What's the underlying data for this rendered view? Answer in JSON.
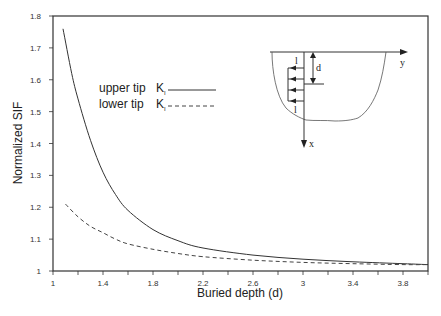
{
  "chart_data": {
    "type": "line",
    "title": "",
    "xlabel": "Buried depth  (d)",
    "ylabel": "Normalized SIF",
    "xlim": [
      1,
      4
    ],
    "ylim": [
      1,
      1.8
    ],
    "grid": false,
    "x_ticks": [
      1,
      1.2,
      1.4,
      1.6,
      1.8,
      2.0,
      2.2,
      2.4,
      2.6,
      2.8,
      3.0,
      3.2,
      3.4,
      3.6,
      3.8,
      4.0
    ],
    "x_tick_labels": [
      "1",
      "",
      "1.4",
      "",
      "1.8",
      "",
      "2.2",
      "",
      "2.6",
      "",
      "3",
      "",
      "3.4",
      "",
      "3.8",
      ""
    ],
    "y_ticks": [
      1,
      1.1,
      1.2,
      1.3,
      1.4,
      1.5,
      1.6,
      1.7,
      1.8
    ],
    "y_tick_labels": [
      "1",
      "1.1",
      "1.2",
      "1.3",
      "1.4",
      "1.5",
      "1.6",
      "1.7",
      "1.8"
    ],
    "legend": {
      "position": "upper-center",
      "entries": [
        {
          "label": "upper tip",
          "symbol": "K",
          "subscript": "I",
          "style": "solid"
        },
        {
          "label": "lower tip",
          "symbol": "K",
          "subscript": "I",
          "style": "dashed"
        }
      ]
    },
    "series": [
      {
        "name": "upper tip K_I",
        "style": "solid",
        "x": [
          1.08,
          1.15,
          1.2,
          1.3,
          1.4,
          1.5,
          1.6,
          1.8,
          2.0,
          2.2,
          2.6,
          3.0,
          3.4,
          3.8,
          4.0
        ],
        "y": [
          1.76,
          1.62,
          1.54,
          1.41,
          1.31,
          1.24,
          1.19,
          1.13,
          1.095,
          1.072,
          1.05,
          1.037,
          1.029,
          1.023,
          1.02
        ]
      },
      {
        "name": "lower tip K_I",
        "style": "dashed",
        "x": [
          1.1,
          1.2,
          1.3,
          1.4,
          1.5,
          1.6,
          1.8,
          2.0,
          2.2,
          2.6,
          3.0,
          3.4,
          3.8,
          4.0
        ],
        "y": [
          1.21,
          1.17,
          1.14,
          1.12,
          1.1,
          1.085,
          1.068,
          1.055,
          1.045,
          1.034,
          1.027,
          1.023,
          1.02,
          1.02
        ]
      }
    ],
    "inset": {
      "description": "schematic of buried crack below surface",
      "labels": {
        "y_axis": "y",
        "x_axis": "x",
        "depth": "d",
        "crack_top": "l",
        "crack_bottom": "l"
      }
    }
  }
}
